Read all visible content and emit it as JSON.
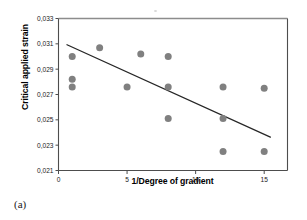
{
  "figure": {
    "caption": "(a)",
    "speck_name": "scan-artifact"
  },
  "chart_data": {
    "type": "scatter",
    "title": "",
    "subtitle": "",
    "xlabel": "1/Degree of gradient",
    "ylabel": "Critical applied strain",
    "xlim": [
      0,
      16.7
    ],
    "ylim": [
      0.021,
      0.033
    ],
    "xticks": [
      0,
      5,
      10,
      15
    ],
    "xtick_labels": [
      "0",
      "5",
      "10",
      "15"
    ],
    "yticks": [
      0.021,
      0.023,
      0.025,
      0.027,
      0.029,
      0.031,
      0.033
    ],
    "ytick_labels": [
      "0,021",
      "0,023",
      "0,025",
      "0,027",
      "0,029",
      "0,031",
      "0,033"
    ],
    "grid": false,
    "legend": false,
    "legend_position": "none",
    "decimal_separator": ",",
    "marker": {
      "shape": "circle",
      "color": "#808080",
      "size_px": 7
    },
    "series": [
      {
        "name": "Critical applied strain measurements",
        "type": "scatter",
        "points": [
          {
            "x": 1.0,
            "y": 0.03
          },
          {
            "x": 1.0,
            "y": 0.0282
          },
          {
            "x": 1.0,
            "y": 0.0276
          },
          {
            "x": 3.0,
            "y": 0.0307
          },
          {
            "x": 5.0,
            "y": 0.0276
          },
          {
            "x": 6.0,
            "y": 0.0302
          },
          {
            "x": 8.0,
            "y": 0.03
          },
          {
            "x": 8.0,
            "y": 0.0276
          },
          {
            "x": 8.0,
            "y": 0.0251
          },
          {
            "x": 12.0,
            "y": 0.0276
          },
          {
            "x": 12.0,
            "y": 0.0251
          },
          {
            "x": 12.0,
            "y": 0.0225
          },
          {
            "x": 15.0,
            "y": 0.0275
          },
          {
            "x": 15.0,
            "y": 0.0225
          }
        ]
      },
      {
        "name": "Linear trend line",
        "type": "line",
        "color": "#262626",
        "width_px": 1.3,
        "endpoints": [
          {
            "x": 0.62,
            "y": 0.03093
          },
          {
            "x": 15.45,
            "y": 0.02363
          }
        ]
      }
    ]
  },
  "axes_style": {
    "frame_color": "#4d4d4d",
    "tick_color": "#4d4d4d",
    "top_border_color": "#8c8c8c",
    "plot_background": "#ffffff"
  }
}
